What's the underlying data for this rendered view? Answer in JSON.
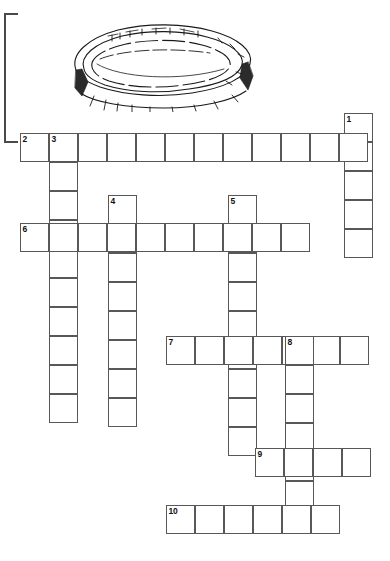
{
  "page": {
    "background_color": "#ffffff",
    "width": 390,
    "height": 561
  },
  "illustration": {
    "name": "stadium-line-drawing",
    "description": "Line drawing of an oval stadium / arena seen in perspective",
    "stroke_color": "#1a1a1a",
    "fill_color": "#ffffff"
  },
  "page_edge_rule": {
    "name": "page-edge-bracket",
    "color": "#4a4a4a"
  },
  "crossword": {
    "cell_size": 29,
    "border_color": "#58585a",
    "cell_fill": "#ffffff",
    "number_color": "#111111",
    "entries": [
      {
        "number": "1",
        "direction": "down",
        "x": 344,
        "y": 113,
        "length": 5
      },
      {
        "number": "2",
        "direction": "across",
        "x": 20,
        "y": 133,
        "length": 12
      },
      {
        "number": "3",
        "direction": "down",
        "x": 49,
        "y": 133,
        "length": 10
      },
      {
        "number": "4",
        "direction": "down",
        "x": 108,
        "y": 195,
        "length": 8
      },
      {
        "number": "5",
        "direction": "down",
        "x": 228,
        "y": 195,
        "length": 9
      },
      {
        "number": "6",
        "direction": "across",
        "x": 20,
        "y": 223,
        "length": 10
      },
      {
        "number": "7",
        "direction": "across",
        "x": 166,
        "y": 336,
        "length": 7
      },
      {
        "number": "8",
        "direction": "down",
        "x": 285,
        "y": 336,
        "length": 6
      },
      {
        "number": "9",
        "direction": "across",
        "x": 255,
        "y": 448,
        "length": 4
      },
      {
        "number": "10",
        "direction": "across",
        "x": 166,
        "y": 505,
        "length": 6
      }
    ],
    "numbers": [
      "1",
      "2",
      "3",
      "4",
      "5",
      "6",
      "7",
      "8",
      "9",
      "10"
    ]
  }
}
